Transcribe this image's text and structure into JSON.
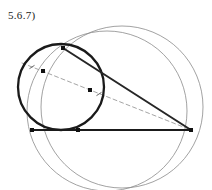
{
  "figure": {
    "label": "5.6.7)",
    "width": 212,
    "height": 190,
    "background_color": "#ffffff"
  },
  "styles": {
    "bold_stroke_color": "#1a1a1a",
    "bold_stroke_width": 2.3,
    "thin_stroke_color": "#8a8a8a",
    "thin_stroke_width": 0.8,
    "chord_stroke_color": "#262626",
    "chord_stroke_width": 2.0,
    "baseline_stroke_color": "#6e6e6e",
    "baseline_stroke_width": 1.5,
    "dashed_stroke_color": "#9a9a9a",
    "dashed_stroke_width": 0.9,
    "dash_pattern": "4,3",
    "marker_color": "#111111",
    "marker_size": 4,
    "tick_color": "#555555",
    "tick_width": 0.9
  },
  "shapes": {
    "circles": [
      {
        "name": "bold-small-circle",
        "cx": 61,
        "cy": 87,
        "r": 43,
        "emphasis": "bold",
        "stroke": "#1a1a1a",
        "stroke_width": 2.3
      },
      {
        "name": "large-circle-left",
        "cx": 107,
        "cy": 111,
        "r": 80,
        "emphasis": "thin",
        "stroke": "#8a8a8a",
        "stroke_width": 0.8
      },
      {
        "name": "large-circle-right",
        "cx": 122,
        "cy": 107,
        "r": 81,
        "emphasis": "thin",
        "stroke": "#8a8a8a",
        "stroke_width": 0.8
      }
    ],
    "lines": [
      {
        "name": "baseline-horizontal",
        "x1": 32,
        "y1": 130,
        "x2": 191,
        "y2": 130,
        "style": "solid",
        "stroke": "#6e6e6e",
        "stroke_width": 1.5
      },
      {
        "name": "chord-bold-diagonal",
        "x1": 63,
        "y1": 48,
        "x2": 191,
        "y2": 130,
        "style": "solid",
        "stroke": "#262626",
        "stroke_width": 2.0
      },
      {
        "name": "chord-bold-lower-left",
        "x1": 32,
        "y1": 130,
        "x2": 191,
        "y2": 130,
        "style": "solid",
        "stroke": "#1a1a1a",
        "stroke_width": 2.0
      },
      {
        "name": "dashed-diagonal",
        "x1": 22,
        "y1": 63,
        "x2": 191,
        "y2": 130,
        "style": "dashed",
        "stroke": "#9a9a9a",
        "stroke_width": 0.9
      }
    ],
    "points": [
      {
        "name": "point-upper-left-on-dashed",
        "cx": 43,
        "cy": 71
      },
      {
        "name": "point-mid-on-dashed",
        "cx": 90,
        "cy": 90
      },
      {
        "name": "point-top-intersection",
        "cx": 63,
        "cy": 48
      },
      {
        "name": "point-bottom-left",
        "cx": 32,
        "cy": 130
      },
      {
        "name": "point-bottom-mid",
        "cx": 78,
        "cy": 130
      },
      {
        "name": "point-right-vertex",
        "cx": 191,
        "cy": 130
      }
    ],
    "tick_marks": [
      {
        "name": "tick-segment-one",
        "cx": 32,
        "cy": 67,
        "angle": 21.6
      },
      {
        "name": "tick-segment-two",
        "cx": 99,
        "cy": 94,
        "angle": 21.6
      }
    ]
  }
}
